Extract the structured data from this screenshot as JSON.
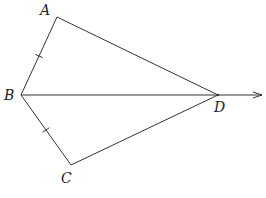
{
  "diagram": {
    "type": "geometry",
    "stroke_color": "#333333",
    "background": "#ffffff",
    "points": {
      "A": {
        "label": "A",
        "x": 57,
        "y": 17,
        "label_x": 40,
        "label_y": 15
      },
      "B": {
        "label": "B",
        "x": 21,
        "y": 95,
        "label_x": 4,
        "label_y": 100
      },
      "C": {
        "label": "C",
        "x": 71,
        "y": 165,
        "label_x": 61,
        "label_y": 183
      },
      "D": {
        "label": "D",
        "x": 218,
        "y": 95,
        "label_x": 214,
        "label_y": 112
      }
    },
    "segments": [
      {
        "from": "A",
        "to": "B",
        "tick_marks": 1
      },
      {
        "from": "B",
        "to": "C",
        "tick_marks": 1
      },
      {
        "from": "A",
        "to": "D",
        "tick_marks": 0
      },
      {
        "from": "C",
        "to": "D",
        "tick_marks": 0
      }
    ],
    "rays": [
      {
        "from": "B",
        "through": "D",
        "arrow_end": {
          "x": 262,
          "y": 95
        }
      }
    ],
    "labels": {
      "A": "A",
      "B": "B",
      "C": "C",
      "D": "D"
    }
  }
}
